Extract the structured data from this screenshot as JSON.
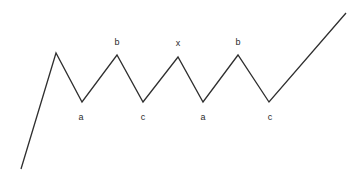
{
  "diagram": {
    "canvas": {
      "width": 364,
      "height": 181
    },
    "background_color": "#ffffff",
    "stroke_color": "#2f2f2f",
    "stroke_width": 1.3,
    "label_color": "#2b2b2b",
    "label_font_size": 9,
    "path_points": "21,169 56,53 82,102 117,55 143,102 178,57 203,102 238,55 269,102 346,13",
    "vertices": [
      {
        "name": "start",
        "x": 21,
        "y": 169,
        "label": "",
        "label_x": 0,
        "label_y": 0
      },
      {
        "name": "peak-1",
        "x": 56,
        "y": 53,
        "label": "",
        "label_x": 0,
        "label_y": 0
      },
      {
        "name": "trough-a-1",
        "x": 82,
        "y": 102,
        "label": "a",
        "label_x": 81,
        "label_y": 117
      },
      {
        "name": "peak-b-1",
        "x": 117,
        "y": 55,
        "label": "b",
        "label_x": 117,
        "label_y": 42
      },
      {
        "name": "trough-c-1",
        "x": 143,
        "y": 102,
        "label": "c",
        "label_x": 143,
        "label_y": 117
      },
      {
        "name": "peak-x",
        "x": 178,
        "y": 57,
        "label": "x",
        "label_x": 178,
        "label_y": 43
      },
      {
        "name": "trough-a-2",
        "x": 203,
        "y": 102,
        "label": "a",
        "label_x": 203,
        "label_y": 117
      },
      {
        "name": "peak-b-2",
        "x": 238,
        "y": 55,
        "label": "b",
        "label_x": 238,
        "label_y": 42
      },
      {
        "name": "trough-c-2",
        "x": 269,
        "y": 102,
        "label": "c",
        "label_x": 270,
        "label_y": 117
      },
      {
        "name": "end",
        "x": 346,
        "y": 13,
        "label": "",
        "label_x": 0,
        "label_y": 0
      }
    ],
    "labels": [
      {
        "name": "label-a-1",
        "text": "a",
        "x": 81,
        "y": 117
      },
      {
        "name": "label-b-1",
        "text": "b",
        "x": 117,
        "y": 42
      },
      {
        "name": "label-c-1",
        "text": "c",
        "x": 143,
        "y": 117
      },
      {
        "name": "label-x",
        "text": "x",
        "x": 178,
        "y": 43
      },
      {
        "name": "label-a-2",
        "text": "a",
        "x": 203,
        "y": 117
      },
      {
        "name": "label-b-2",
        "text": "b",
        "x": 238,
        "y": 42
      },
      {
        "name": "label-c-2",
        "text": "c",
        "x": 270,
        "y": 117
      }
    ]
  }
}
